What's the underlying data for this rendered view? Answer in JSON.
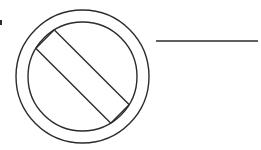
{
  "figure": {
    "background_color": "#ffffff",
    "stroke_color": "#2b2b2b",
    "canvas": {
      "width": 261,
      "height": 150
    },
    "elements": {
      "outer_circle": {
        "name": "outer-circle",
        "center_x": 82.5,
        "center_y": 76.5,
        "radius": 66.5,
        "stroke_width": 1.4
      },
      "inner_circle": {
        "name": "inner-circle",
        "center_x": 82.5,
        "center_y": 76.5,
        "radius": 54.5,
        "stroke_width": 1.4
      },
      "diagonal_bar": {
        "name": "diagonal-slash-bar",
        "description": "outlined thick diagonal band from upper-left to lower-right clipped by inner circle",
        "stroke_width": 1.4,
        "angle_degrees": 45,
        "half_thickness": 13
      },
      "horizontal_rule": {
        "name": "horizontal-rule",
        "x_start": 156,
        "x_end": 258,
        "y": 41,
        "stroke_width": 1.3
      },
      "corner_mark": {
        "name": "corner-tick-mark",
        "x": 0,
        "y": 20,
        "width": 2,
        "height": 5
      }
    }
  }
}
